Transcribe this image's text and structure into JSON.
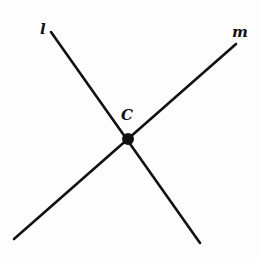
{
  "diagram": {
    "lines": [
      {
        "name": "l",
        "label": "l",
        "x1": 51,
        "y1": 32,
        "x2": 200,
        "y2": 243,
        "label_x": 40,
        "label_y": 34
      },
      {
        "name": "m",
        "label": "m",
        "x1": 236,
        "y1": 44,
        "x2": 14,
        "y2": 239,
        "label_x": 232,
        "label_y": 37
      }
    ],
    "points": [
      {
        "name": "C",
        "label": "C",
        "x": 128,
        "y": 139,
        "label_x": 121,
        "label_y": 120
      }
    ],
    "colors": {
      "stroke": "#111111",
      "background": "#fdfdfd"
    }
  }
}
